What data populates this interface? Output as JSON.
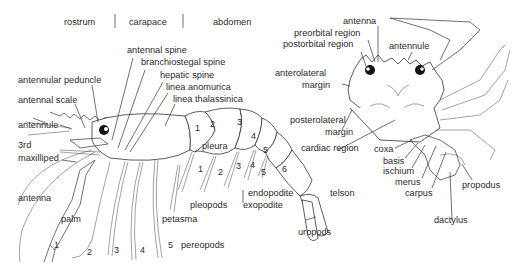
{
  "header_regions": [
    "rostrum",
    "carapace",
    "abdomen"
  ],
  "lobster": {
    "labels": {
      "antennal_spine": "antennal spine",
      "branchiostegal_spine": "branchiostegal spine",
      "hepatic_spine": "hepatic spine",
      "linea_anomurica": "linea anomurica",
      "linea_thalassinica": "linea thalassinica",
      "antennular_peduncle": "antennular peduncle",
      "antennal_scale": "antennal scale",
      "antennule": "antennule",
      "third_maxilliped_1": "3rd",
      "third_maxilliped_2": "maxilliped",
      "antenna": "antenna",
      "palm": "palm",
      "petasma": "petasma",
      "pleopods": "pleopods",
      "pleura": "pleura",
      "endopodite": "endopodite",
      "exopodite": "exopodite",
      "telson": "telson",
      "uropods": "uropods",
      "pereopods": "pereopods"
    },
    "abdominal_segments": [
      "1",
      "2",
      "3",
      "4",
      "5",
      "6"
    ],
    "pleopod_numbers": [
      "1",
      "2",
      "3",
      "4",
      "5"
    ],
    "pereopod_numbers": [
      "1",
      "2",
      "3",
      "4",
      "5"
    ]
  },
  "crab": {
    "labels": {
      "antenna": "antenna",
      "preorbital_region": "preorbital region",
      "postorbital_region": "postorbital region",
      "antennule": "antennule",
      "anterolateral_margin_1": "anterolateral",
      "anterolateral_margin_2": "margin",
      "posterolateral_margin_1": "posterolateral",
      "posterolateral_margin_2": "margin",
      "cardiac_region": "cardiac region",
      "coxa": "coxa",
      "basis": "basis",
      "ischium": "ischium",
      "merus": "merus",
      "carpus": "carpus",
      "propodus": "propodus",
      "dactylus": "dactylus"
    }
  }
}
